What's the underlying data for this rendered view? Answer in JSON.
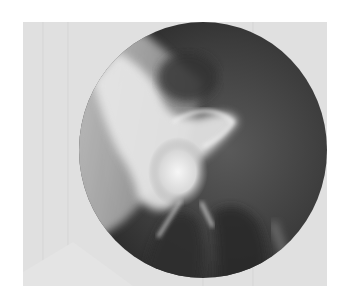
{
  "image": {
    "kind": "radiograph",
    "subject": "hip joint x-ray",
    "colors": {
      "background": "#ffffff",
      "film_light": "#e2e2e2",
      "field_dark": "#3a3a3a",
      "bone_bright": "#f4f4f4"
    }
  }
}
